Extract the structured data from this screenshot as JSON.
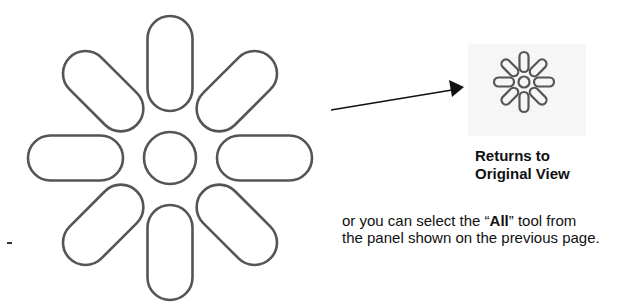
{
  "figure": {
    "large_icon": "reset-view-flower-icon",
    "arrow": "arrow-right-icon",
    "small_icon": "reset-view-flower-icon",
    "stroke_color": "#555555",
    "icon_box_bg": "#f6f6f6"
  },
  "caption": {
    "line1": "Returns to",
    "line2": "Original View"
  },
  "paragraph": {
    "line1_pre": "or you can select the “",
    "line1_bold": "All",
    "line1_post": "” tool from",
    "line2": "the panel shown on the previous page."
  },
  "margin_mark": "-"
}
